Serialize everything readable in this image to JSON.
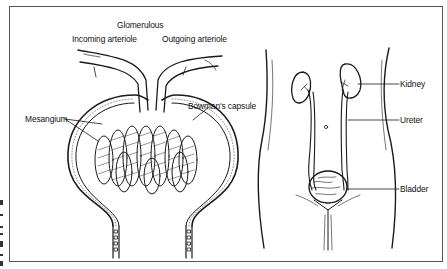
{
  "figure": {
    "left_panel": {
      "name": "Glomerulus and Bowman's capsule",
      "labels": {
        "glomerulous": "Glomerulous",
        "incoming_arteriole": "Incoming arteriole",
        "outgoing_arteriole": "Outgoing arteriole",
        "mesangium": "Mesangium",
        "bowmans_capsule": "Bowman's capsule"
      }
    },
    "right_panel": {
      "name": "Urinary system",
      "labels": {
        "kidney": "Kidney",
        "ureter": "Ureter",
        "bladder": "Bladder"
      }
    },
    "colors": {
      "line": "#1a1a1a",
      "frame": "#555555",
      "background": "#ffffff"
    }
  }
}
